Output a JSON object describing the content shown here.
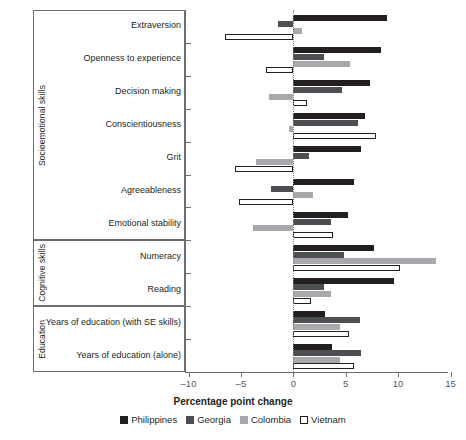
{
  "chart_data": {
    "type": "bar",
    "orientation": "horizontal",
    "title": "",
    "xlabel": "Percentage point change",
    "ylabel": "",
    "xlim": [
      -10,
      15
    ],
    "xticks": [
      -10,
      -5,
      0,
      5,
      10,
      15
    ],
    "xtick_labels": [
      "–10",
      "–5",
      "0",
      "5",
      "10",
      "15"
    ],
    "grid": false,
    "legend_position": "bottom",
    "zero_reference_line": true,
    "categories": [
      "Extraversion",
      "Openness to experience",
      "Decision making",
      "Conscientiousness",
      "Grit",
      "Agreeableness",
      "Emotional stability",
      "Numeracy",
      "Reading",
      "Years of education (with SE skills)",
      "Years of education (alone)"
    ],
    "groups": [
      {
        "label": "Socioemotional skills",
        "categories": [
          "Extraversion",
          "Openness to experience",
          "Decision making",
          "Conscientiousness",
          "Grit",
          "Agreeableness",
          "Emotional stability"
        ]
      },
      {
        "label": "Cognitive skills",
        "categories": [
          "Numeracy",
          "Reading"
        ]
      },
      {
        "label": "Education",
        "categories": [
          "Years of education (with SE skills)",
          "Years of education (alone)"
        ]
      }
    ],
    "series": [
      {
        "name": "Philippines",
        "color": "#231f20",
        "values": [
          8.9,
          8.4,
          7.3,
          6.8,
          6.5,
          5.8,
          5.2,
          7.7,
          9.6,
          3.0,
          3.7
        ]
      },
      {
        "name": "Georgia",
        "color": "#4d4e51",
        "values": [
          -1.5,
          2.9,
          4.6,
          6.2,
          1.5,
          -2.1,
          3.6,
          4.8,
          2.9,
          6.4,
          6.5
        ]
      },
      {
        "name": "Colombia",
        "color": "#a7a9ac",
        "values": [
          0.8,
          5.4,
          -2.3,
          -0.4,
          -3.6,
          1.9,
          -3.8,
          13.6,
          3.6,
          4.5,
          4.5
        ]
      },
      {
        "name": "Vietnam",
        "color": "#ffffff",
        "values": [
          -6.5,
          -2.6,
          1.3,
          7.9,
          -5.6,
          -5.2,
          3.8,
          10.2,
          1.7,
          5.3,
          5.8
        ]
      }
    ]
  },
  "legend": {
    "items": [
      {
        "label": "Philippines"
      },
      {
        "label": "Georgia"
      },
      {
        "label": "Colombia"
      },
      {
        "label": "Vietnam"
      }
    ]
  }
}
